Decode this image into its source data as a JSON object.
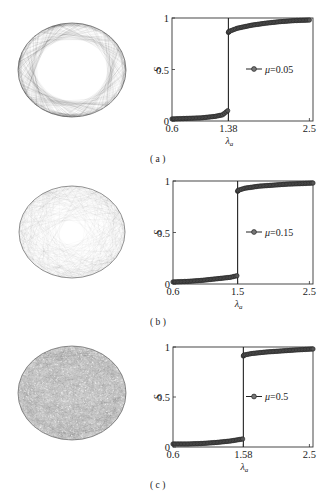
{
  "figure": {
    "panels": [
      {
        "label": "(a)",
        "network_style": "sparse-diamond",
        "legend": "μ=0.05"
      },
      {
        "label": "(b)",
        "network_style": "medium-web",
        "legend": "μ=0.15"
      },
      {
        "label": "(c)",
        "network_style": "dense-noise",
        "legend": "μ=0.5"
      }
    ]
  },
  "chart_data": [
    {
      "type": "line",
      "title": "",
      "panel_label": "(a)",
      "xlabel": "λ_a",
      "ylabel": "S",
      "xlim": [
        0.6,
        2.55
      ],
      "ylim": [
        0,
        1
      ],
      "xticks": [
        0.6,
        1.38,
        2.5
      ],
      "xtick_labels": [
        "0.6",
        "1.38",
        "2.5"
      ],
      "yticks": [
        0,
        0.5,
        1
      ],
      "ytick_labels": [
        "0",
        "0.5",
        "1"
      ],
      "threshold": 1.38,
      "legend_position": "center-right",
      "series": [
        {
          "name": "μ=0.05",
          "marker": "circle",
          "x": [
            0.6,
            0.8,
            1.0,
            1.2,
            1.3,
            1.37,
            1.38,
            1.39,
            1.5,
            1.7,
            1.9,
            2.1,
            2.3,
            2.5
          ],
          "y": [
            0.02,
            0.025,
            0.03,
            0.045,
            0.06,
            0.1,
            0.86,
            0.87,
            0.9,
            0.93,
            0.95,
            0.965,
            0.975,
            0.98
          ]
        }
      ]
    },
    {
      "type": "line",
      "title": "",
      "panel_label": "(b)",
      "xlabel": "λ_a",
      "ylabel": "S",
      "xlim": [
        0.6,
        2.55
      ],
      "ylim": [
        0,
        1
      ],
      "xticks": [
        0.6,
        1.5,
        2.5
      ],
      "xtick_labels": [
        "0.6",
        "1.5",
        "2.5"
      ],
      "yticks": [
        0,
        0.5,
        1
      ],
      "ytick_labels": [
        "0",
        "0.5",
        "1"
      ],
      "threshold": 1.5,
      "legend_position": "center-right",
      "series": [
        {
          "name": "μ=0.15",
          "marker": "circle",
          "x": [
            0.6,
            0.8,
            1.0,
            1.2,
            1.4,
            1.49,
            1.5,
            1.51,
            1.6,
            1.8,
            2.0,
            2.2,
            2.4,
            2.55
          ],
          "y": [
            0.02,
            0.025,
            0.035,
            0.05,
            0.065,
            0.08,
            0.9,
            0.91,
            0.93,
            0.95,
            0.96,
            0.97,
            0.975,
            0.98
          ]
        }
      ]
    },
    {
      "type": "line",
      "title": "",
      "panel_label": "(c)",
      "xlabel": "λ_a",
      "ylabel": "S",
      "xlim": [
        0.6,
        2.55
      ],
      "ylim": [
        0,
        1
      ],
      "xticks": [
        0.6,
        1.58,
        2.5
      ],
      "xtick_labels": [
        "0.6",
        "1.58",
        "2.5"
      ],
      "yticks": [
        0,
        0.5,
        1
      ],
      "ytick_labels": [
        "0",
        "0.5",
        "1"
      ],
      "threshold": 1.58,
      "legend_position": "center-right",
      "series": [
        {
          "name": "μ=0.5",
          "marker": "circle",
          "x": [
            0.6,
            0.8,
            1.0,
            1.2,
            1.4,
            1.57,
            1.58,
            1.59,
            1.7,
            1.9,
            2.1,
            2.3,
            2.55
          ],
          "y": [
            0.03,
            0.03,
            0.035,
            0.045,
            0.06,
            0.08,
            0.91,
            0.92,
            0.935,
            0.95,
            0.96,
            0.97,
            0.98
          ]
        }
      ]
    }
  ]
}
